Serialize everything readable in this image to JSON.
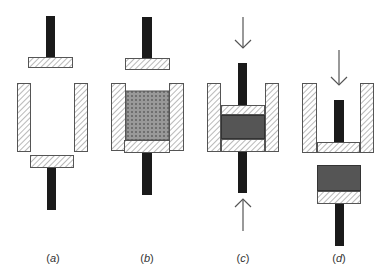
{
  "figure": {
    "colors": {
      "rod": "#1a1a1a",
      "hatch_fill": "#ffffff",
      "hatch_line": "#8a8a8a",
      "outline": "#555555",
      "compact": "#555555",
      "powder_bg": "#7a7a7a",
      "powder_dot": "#d8d8d8",
      "arrow": "#555555"
    },
    "panels": [
      {
        "id": "a",
        "label_open": "(",
        "label_letter": "a",
        "label_close": ")",
        "label_x": 53,
        "caption": "Empty die with upper and lower punches",
        "rods": [
          {
            "x": 46,
            "y": 16,
            "w": 9,
            "h": 41
          },
          {
            "x": 47,
            "y": 168,
            "w": 9,
            "h": 42
          }
        ],
        "hatched": [
          {
            "x": 28,
            "y": 57,
            "w": 45,
            "h": 11
          },
          {
            "x": 17,
            "y": 83,
            "w": 14,
            "h": 69
          },
          {
            "x": 74,
            "y": 83,
            "w": 14,
            "h": 69
          },
          {
            "x": 30,
            "y": 155,
            "w": 44,
            "h": 13
          }
        ],
        "compacts": [],
        "powder": [],
        "arrows": []
      },
      {
        "id": "b",
        "label_open": "(",
        "label_letter": "b",
        "label_close": ")",
        "label_x": 147,
        "caption": "Die filled with powder",
        "rods": [
          {
            "x": 142,
            "y": 17,
            "w": 10,
            "h": 41
          },
          {
            "x": 142,
            "y": 153,
            "w": 10,
            "h": 42
          }
        ],
        "hatched": [
          {
            "x": 125,
            "y": 58,
            "w": 45,
            "h": 12
          },
          {
            "x": 111,
            "y": 83,
            "w": 15,
            "h": 68
          },
          {
            "x": 169,
            "y": 83,
            "w": 15,
            "h": 68
          },
          {
            "x": 124,
            "y": 140,
            "w": 46,
            "h": 13
          }
        ],
        "compacts": [],
        "powder": [
          {
            "x": 126,
            "y": 91,
            "w": 43,
            "h": 49
          }
        ],
        "arrows": []
      },
      {
        "id": "c",
        "label_open": "(",
        "label_letter": "c",
        "label_close": ")",
        "label_x": 243,
        "caption": "Powder compressed between punches",
        "rods": [
          {
            "x": 238,
            "y": 63,
            "w": 9,
            "h": 42
          },
          {
            "x": 238,
            "y": 152,
            "w": 9,
            "h": 41
          }
        ],
        "hatched": [
          {
            "x": 207,
            "y": 83,
            "w": 14,
            "h": 69
          },
          {
            "x": 265,
            "y": 83,
            "w": 14,
            "h": 69
          },
          {
            "x": 221,
            "y": 105,
            "w": 44,
            "h": 10
          },
          {
            "x": 221,
            "y": 139,
            "w": 44,
            "h": 13
          }
        ],
        "compacts": [
          {
            "x": 221,
            "y": 115,
            "w": 44,
            "h": 24
          }
        ],
        "powder": [],
        "arrows": [
          {
            "direction": "down",
            "x": 243,
            "y1": 17,
            "y2": 48
          },
          {
            "direction": "up",
            "x": 243,
            "y1": 231,
            "y2": 199
          }
        ]
      },
      {
        "id": "d",
        "label_open": "(",
        "label_letter": "d",
        "label_close": ")",
        "label_x": 339,
        "caption": "Compact ejected from die",
        "rods": [
          {
            "x": 334,
            "y": 100,
            "w": 10,
            "h": 42
          },
          {
            "x": 335,
            "y": 204,
            "w": 9,
            "h": 42
          }
        ],
        "hatched": [
          {
            "x": 302,
            "y": 83,
            "w": 15,
            "h": 70
          },
          {
            "x": 360,
            "y": 83,
            "w": 14,
            "h": 70
          },
          {
            "x": 317,
            "y": 142,
            "w": 43,
            "h": 11
          },
          {
            "x": 317,
            "y": 191,
            "w": 44,
            "h": 13
          }
        ],
        "compacts": [
          {
            "x": 317,
            "y": 165,
            "w": 44,
            "h": 26
          }
        ],
        "powder": [],
        "arrows": [
          {
            "direction": "down",
            "x": 339,
            "y1": 50,
            "y2": 85
          }
        ]
      }
    ],
    "label_y": 262
  }
}
